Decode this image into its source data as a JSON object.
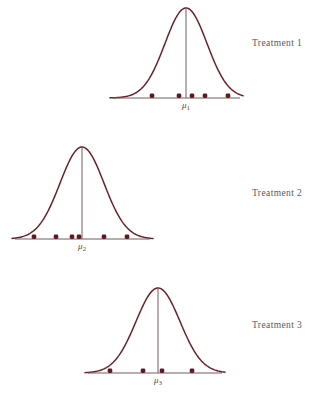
{
  "figure": {
    "title": "",
    "background_color": "#ffffff",
    "curve_color": "#6b2228",
    "axis_color": "#7b5a5c",
    "dot_color": "#5e1a20",
    "label_color": "#5a5a62",
    "width": 319,
    "height": 400
  },
  "panels": [
    {
      "label": "Treatment 1",
      "mu_symbol": "μ",
      "mu_subscript": "1",
      "label_x": 252,
      "label_y": 38,
      "baseline_y": 98,
      "baseline_x_start": 113,
      "baseline_x_end": 240,
      "peak_x": 186,
      "peak_y": 8,
      "sigma": 21,
      "mu_label_x": 186,
      "mu_label_y": 100,
      "dots": [
        152,
        179,
        192,
        205,
        228
      ]
    },
    {
      "label": "Treatment 2",
      "mu_symbol": "μ",
      "mu_subscript": "2",
      "label_x": 252,
      "label_y": 188,
      "baseline_y": 239,
      "baseline_x_start": 15,
      "baseline_x_end": 150,
      "peak_x": 82,
      "peak_y": 147,
      "sigma": 22,
      "mu_label_x": 82,
      "mu_label_y": 241,
      "dots": [
        34,
        56,
        72,
        79,
        104,
        127
      ]
    },
    {
      "label": "Treatment 3",
      "mu_symbol": "μ",
      "mu_subscript": "3",
      "label_x": 252,
      "label_y": 320,
      "baseline_y": 373,
      "baseline_x_start": 88,
      "baseline_x_end": 222,
      "peak_x": 158,
      "peak_y": 288,
      "sigma": 22,
      "mu_label_x": 158,
      "mu_label_y": 375,
      "dots": [
        110,
        143,
        162,
        192
      ]
    }
  ],
  "caption": {
    "text": "",
    "y": 390
  },
  "chart_data": {
    "type": "line",
    "title": "",
    "xlabel": "",
    "ylabel": "",
    "series": [
      {
        "name": "Treatment 1",
        "distribution": "normal",
        "mean_label": "μ1",
        "observations_count": 5
      },
      {
        "name": "Treatment 2",
        "distribution": "normal",
        "mean_label": "μ2",
        "observations_count": 6
      },
      {
        "name": "Treatment 3",
        "distribution": "normal",
        "mean_label": "μ3",
        "observations_count": 4
      }
    ]
  }
}
